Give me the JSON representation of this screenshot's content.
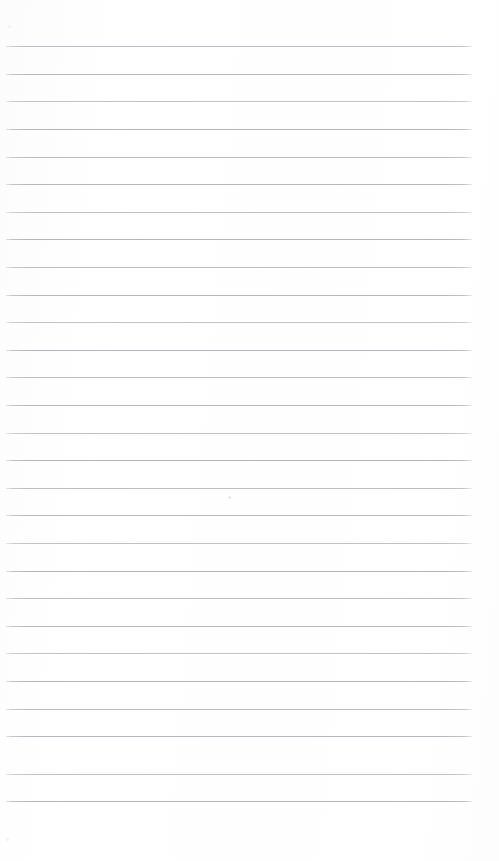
{
  "document": {
    "kind": "lined-notepaper-scan",
    "title": "Blank lined paper",
    "text_content": "",
    "width_px": 499,
    "height_px": 861,
    "background_color": "#fefefe",
    "has_text": false,
    "has_heading": false,
    "has_margin_rule": false,
    "page_number": ""
  },
  "ruling": {
    "line_color": "#b9bdc1",
    "line_thickness_px": 1,
    "line_count": 28,
    "first_line_y": 46,
    "line_spacing_px": 27.6,
    "line_start_x": 6,
    "line_end_x": 472,
    "top_margin_px": 46,
    "bottom_margin_px": 60,
    "left_margin_px": 6,
    "right_margin_px": 27,
    "lines": [
      {
        "index": 1,
        "y": 46,
        "tone": "#babec2"
      },
      {
        "index": 2,
        "y": 74,
        "tone": "#b5b9bd"
      },
      {
        "index": 3,
        "y": 101,
        "tone": "#c0c4c7"
      },
      {
        "index": 4,
        "y": 129,
        "tone": "#b2b6ba"
      },
      {
        "index": 5,
        "y": 157,
        "tone": "#babec2"
      },
      {
        "index": 6,
        "y": 184,
        "tone": "#b5b9bd"
      },
      {
        "index": 7,
        "y": 212,
        "tone": "#c0c4c7"
      },
      {
        "index": 8,
        "y": 239,
        "tone": "#b2b6ba"
      },
      {
        "index": 9,
        "y": 267,
        "tone": "#babec2"
      },
      {
        "index": 10,
        "y": 295,
        "tone": "#b5b9bd"
      },
      {
        "index": 11,
        "y": 322,
        "tone": "#c0c4c7"
      },
      {
        "index": 12,
        "y": 350,
        "tone": "#b2b6ba"
      },
      {
        "index": 13,
        "y": 377,
        "tone": "#babec2"
      },
      {
        "index": 14,
        "y": 405,
        "tone": "#b5b9bd"
      },
      {
        "index": 15,
        "y": 433,
        "tone": "#c0c4c7"
      },
      {
        "index": 16,
        "y": 460,
        "tone": "#b2b6ba"
      },
      {
        "index": 17,
        "y": 488,
        "tone": "#babec2"
      },
      {
        "index": 18,
        "y": 515,
        "tone": "#b5b9bd"
      },
      {
        "index": 19,
        "y": 543,
        "tone": "#c0c4c7"
      },
      {
        "index": 20,
        "y": 571,
        "tone": "#b2b6ba"
      },
      {
        "index": 21,
        "y": 598,
        "tone": "#babec2"
      },
      {
        "index": 22,
        "y": 626,
        "tone": "#b5b9bd"
      },
      {
        "index": 23,
        "y": 653,
        "tone": "#c0c4c7"
      },
      {
        "index": 24,
        "y": 681,
        "tone": "#b2b6ba"
      },
      {
        "index": 25,
        "y": 709,
        "tone": "#babec2"
      },
      {
        "index": 26,
        "y": 736,
        "tone": "#b5b9bd"
      },
      {
        "index": 27,
        "y": 774,
        "tone": "#c0c4c7"
      },
      {
        "index": 28,
        "y": 801,
        "tone": "#b2b6ba"
      }
    ]
  },
  "artifacts": {
    "specks": [
      {
        "x": 8,
        "y": 25,
        "size": 3,
        "color": "#f0f1f2"
      },
      {
        "x": 228,
        "y": 496,
        "size": 3,
        "color": "#e9eaec"
      },
      {
        "x": 6,
        "y": 838,
        "size": 3,
        "color": "#f2f3f4"
      }
    ]
  }
}
